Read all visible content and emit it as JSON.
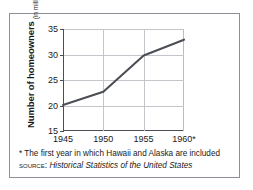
{
  "figure": {
    "y_axis_title_main": "Number of homeowners",
    "y_axis_title_sub": "(in millions)",
    "footnote": "* The first year in which Hawaii and Alaska are included",
    "source_label": "SOURCE:",
    "source_title": "Historical Statistics of the United States",
    "colors": {
      "line": "#4b4f55",
      "grid": "#c2c5ca",
      "axis": "#4b4f55",
      "frame": "#8d9096",
      "text": "#1a1a1a",
      "background": "#ffffff"
    }
  },
  "chart_data": {
    "type": "line",
    "title": "",
    "xlabel": "",
    "ylabel": "Number of homeowners (in millions)",
    "x": [
      1945,
      1950,
      1955,
      1960
    ],
    "categories": [
      "1945",
      "1950",
      "1955",
      "1960*"
    ],
    "values": [
      20.1,
      22.7,
      29.8,
      32.9
    ],
    "series": [
      {
        "name": "Number of homeowners",
        "values": [
          20.1,
          22.7,
          29.8,
          32.9
        ]
      }
    ],
    "xlim": [
      1945,
      1960
    ],
    "ylim": [
      15,
      35
    ],
    "ytick_labels": [
      "15",
      "20",
      "25",
      "30",
      "35"
    ],
    "ytick_values": [
      15,
      20,
      25,
      30,
      35
    ],
    "xtick_labels": [
      "1945",
      "1950",
      "1955",
      "1960*"
    ],
    "xtick_values": [
      1945,
      1950,
      1955,
      1960
    ],
    "grid": "horizontal and vertical interior gridlines",
    "legend": "none",
    "annotations": [
      "* The first year in which Hawaii and Alaska are included",
      "SOURCE: Historical Statistics of the United States"
    ]
  }
}
